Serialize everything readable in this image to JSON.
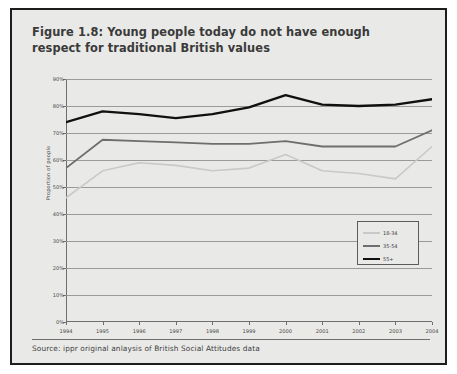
{
  "figure": {
    "title": "Figure 1.8: Young people today do not have enough respect for traditional British values",
    "source": "Source: ippr original anlaysis of British Social Attitudes data"
  },
  "colors": {
    "panel_background": "#e9e9e7",
    "panel_border": "#1d1d1d",
    "axis": "#6e6e6e",
    "grid": "#9a9a9a",
    "series_18_34": "#c9c9c9",
    "series_35_54": "#6e6e6e",
    "series_55_plus": "#101010"
  },
  "chart_data": {
    "type": "line",
    "title": "Figure 1.8: Young people today do not have enough respect for traditional British values",
    "xlabel": "",
    "ylabel": "Proportion of people",
    "categories": [
      "1994",
      "1995",
      "1996",
      "1997",
      "1998",
      "1999",
      "2000",
      "2001",
      "2002",
      "2003",
      "2004"
    ],
    "x_tick_labels": [
      "1994",
      "1995",
      "1996",
      "1997",
      "1998",
      "1999",
      "2000",
      "2001",
      "2002",
      "2003",
      "2004"
    ],
    "y_tick_labels": [
      "0%",
      "10%",
      "20%",
      "30%",
      "40%",
      "50%",
      "60%",
      "70%",
      "80%",
      "90%"
    ],
    "ylim": [
      0,
      90
    ],
    "y_tick_values": [
      0,
      10,
      20,
      30,
      40,
      50,
      60,
      70,
      80,
      90
    ],
    "grid": true,
    "grid_axis": "y",
    "legend_position": "inside-right",
    "series": [
      {
        "name": "18-34",
        "color": "#c9c9c9",
        "values": [
          46,
          56,
          59,
          58,
          56,
          57,
          62,
          56,
          55,
          53,
          65
        ]
      },
      {
        "name": "35-54",
        "color": "#6e6e6e",
        "values": [
          57,
          67.5,
          67,
          66.5,
          66,
          66,
          67,
          65,
          65,
          65,
          71
        ]
      },
      {
        "name": "55+",
        "color": "#101010",
        "values": [
          74,
          78,
          77,
          75.5,
          77,
          79.5,
          84,
          80.5,
          80,
          80.5,
          82.5
        ]
      }
    ]
  },
  "legend": {
    "entries": [
      {
        "label": "18-34",
        "color": "#c9c9c9"
      },
      {
        "label": "35-54",
        "color": "#6e6e6e"
      },
      {
        "label": "55+",
        "color": "#101010"
      }
    ]
  }
}
